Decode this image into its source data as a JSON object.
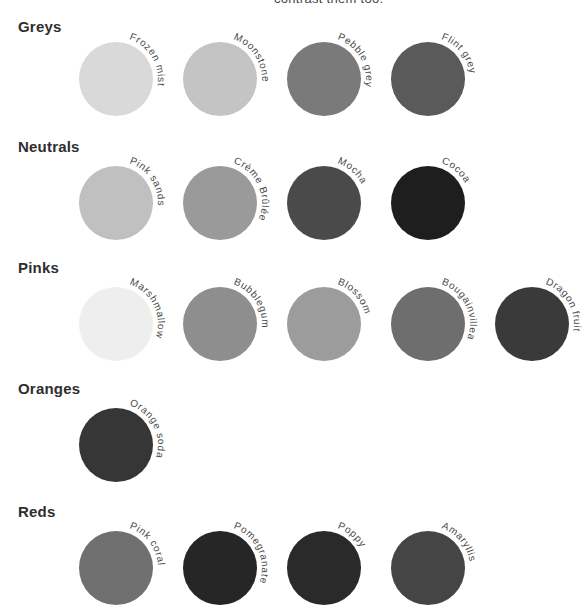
{
  "top_caption": "contrast them too.",
  "groups": [
    {
      "title": "Greys",
      "heading_y": 18,
      "center_y": 79,
      "swatches": [
        {
          "name": "Frozen mist",
          "color": "#d9d9d9"
        },
        {
          "name": "Moonstone",
          "color": "#c4c4c4"
        },
        {
          "name": "Pebble grey",
          "color": "#7a7a7a"
        },
        {
          "name": "Flint grey",
          "color": "#5a5a5a"
        }
      ]
    },
    {
      "title": "Neutrals",
      "heading_y": 138,
      "center_y": 203,
      "swatches": [
        {
          "name": "Pink sands",
          "color": "#c0c0c0"
        },
        {
          "name": "Crème Brûlée",
          "color": "#9a9a9a"
        },
        {
          "name": "Mocha",
          "color": "#4a4a4a"
        },
        {
          "name": "Cocoa",
          "color": "#1e1e1e"
        }
      ]
    },
    {
      "title": "Pinks",
      "heading_y": 259,
      "center_y": 324,
      "swatches": [
        {
          "name": "Marshmallow",
          "color": "#eeeeee"
        },
        {
          "name": "Bubblegum",
          "color": "#8e8e8e"
        },
        {
          "name": "Blossom",
          "color": "#9c9c9c"
        },
        {
          "name": "Bougainvillea",
          "color": "#6e6e6e"
        },
        {
          "name": "Dragon fruit",
          "color": "#3a3a3a"
        }
      ]
    },
    {
      "title": "Oranges",
      "heading_y": 380,
      "center_y": 445,
      "swatches": [
        {
          "name": "Orange soda",
          "color": "#363636"
        }
      ]
    },
    {
      "title": "Reds",
      "heading_y": 503,
      "center_y": 568,
      "swatches": [
        {
          "name": "Pink coral",
          "color": "#707070"
        },
        {
          "name": "Pomegranate",
          "color": "#262626"
        },
        {
          "name": "Poppy",
          "color": "#2a2a2a"
        },
        {
          "name": "Amaryllis",
          "color": "#454545"
        }
      ]
    }
  ],
  "layout": {
    "first_center_x": 116,
    "pitch_x": 104,
    "radius": 37
  }
}
